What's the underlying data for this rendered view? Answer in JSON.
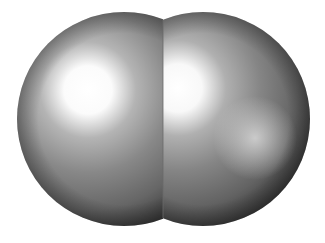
{
  "image": {
    "subject": "space-filling model of a diatomic molecule",
    "background": "#ffffff",
    "caption_cropped": ""
  },
  "atoms": [
    {
      "name": "left-atom",
      "cx": 124,
      "cy": 119,
      "r": 107,
      "base": "#7c7c7c",
      "edge": "#3a3a3a",
      "highlight": "#ffffff",
      "highlight_cx": 88,
      "highlight_cy": 90
    },
    {
      "name": "right-atom",
      "cx": 203,
      "cy": 119,
      "r": 107,
      "base": "#7c7c7c",
      "edge": "#3a3a3a",
      "highlight": "#ffffff",
      "highlight_cx": 178,
      "highlight_cy": 88,
      "secondary_highlight_cx": 255,
      "secondary_highlight_cy": 138
    }
  ],
  "seam_x": 163
}
